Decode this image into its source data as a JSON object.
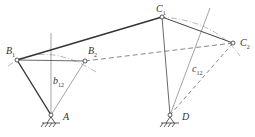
{
  "labels": {
    "B1": {
      "main": "B",
      "sub": "1"
    },
    "B2": {
      "main": "B",
      "sub": "2"
    },
    "C1": {
      "main": "C",
      "sub": "1"
    },
    "C2": {
      "main": "C",
      "sub": "2"
    },
    "A": {
      "main": "A",
      "sub": ""
    },
    "D": {
      "main": "D",
      "sub": ""
    },
    "b12": {
      "main": "b",
      "sub": "12"
    },
    "c12": {
      "main": "c",
      "sub": "12"
    }
  },
  "colors": {
    "line": "#333333",
    "thin": "#666666"
  }
}
